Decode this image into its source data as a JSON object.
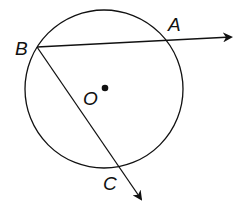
{
  "diagram": {
    "type": "geometry",
    "colors": {
      "stroke": "#111111",
      "background": "#ffffff"
    },
    "circle": {
      "center_label": "O",
      "cx": 104,
      "cy": 89,
      "r": 79
    },
    "points": [
      {
        "label": "B",
        "x": 37,
        "y": 47,
        "on_circle": true
      },
      {
        "label": "A",
        "x": 167,
        "y": 40,
        "on_circle": true
      },
      {
        "label": "C",
        "x": 118,
        "y": 165,
        "on_circle": true
      },
      {
        "label": "O",
        "x": 105,
        "y": 88,
        "on_circle": false
      }
    ],
    "rays": [
      {
        "from": "B",
        "through": "A",
        "end": [
          231,
          37
        ]
      },
      {
        "from": "B",
        "through": "C",
        "end": [
          141,
          199
        ]
      }
    ],
    "labels": {
      "B": "B",
      "A": "A",
      "C": "C",
      "O": "O"
    }
  }
}
